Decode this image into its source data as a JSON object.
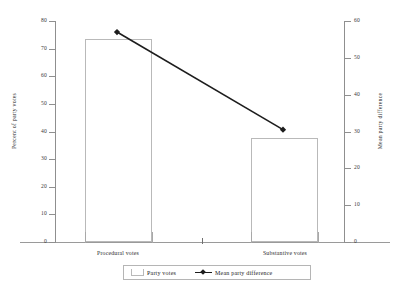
{
  "chart_data": {
    "type": "bar",
    "title": "",
    "categories": [
      "Procedural votes",
      "Substantive votes"
    ],
    "series": [
      {
        "name": "Party votes",
        "type": "bar",
        "axis": "left",
        "values": [
          73.5,
          37.5
        ]
      },
      {
        "name": "Mean party difference",
        "type": "line",
        "axis": "right",
        "values": [
          57,
          30.5
        ]
      }
    ],
    "xlabel": "",
    "ylabel": "Percent of party votes",
    "ylabel_right": "Mean party difference",
    "ylim": [
      0,
      80
    ],
    "ylim_right": [
      0,
      60
    ],
    "yticks": [
      0,
      10,
      20,
      30,
      40,
      50,
      60,
      70,
      80
    ],
    "yticks_right": [
      0,
      10,
      20,
      30,
      40,
      50,
      60
    ],
    "grid": false,
    "legend_position": "bottom"
  },
  "axes": {
    "left": {
      "title": "Percent of party votes",
      "ticks": [
        "0",
        "10",
        "20",
        "30",
        "40",
        "50",
        "60",
        "70",
        "80"
      ]
    },
    "right": {
      "title": "Mean party difference",
      "ticks": [
        "0",
        "10",
        "20",
        "30",
        "40",
        "50",
        "60"
      ]
    },
    "categories": [
      "Procedural votes",
      "Substantive votes"
    ]
  },
  "legend": {
    "bar_label": "Party votes",
    "line_label": "Mean party difference"
  },
  "colors": {
    "bar_outline": "#b9b9b9",
    "bar_fill": "#ffffff",
    "line": "#1d1d1d",
    "axis": "#8f8f8f",
    "text": "#2b2b2b",
    "background": "#ffffff"
  }
}
